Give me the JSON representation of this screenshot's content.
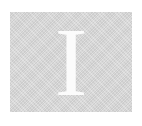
{
  "tile": {
    "letter": "I",
    "background_color": "#d9d9d9",
    "letter_color": "#fbfbfb"
  }
}
